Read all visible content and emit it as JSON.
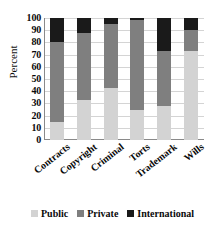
{
  "chart_data": {
    "type": "bar",
    "stacked": true,
    "title": "",
    "xlabel": "",
    "ylabel": "Percent",
    "ylim": [
      0,
      100
    ],
    "ytick_step": 10,
    "yticks": [
      "100",
      "90",
      "80",
      "70",
      "60",
      "50",
      "40",
      "30",
      "20",
      "10",
      "0"
    ],
    "grid": true,
    "legend_position": "bottom",
    "categories": [
      "Contracts",
      "Copyright",
      "Criminal",
      "Torts",
      "Trademark",
      "Wills"
    ],
    "series": [
      {
        "name": "Public",
        "color": "#d3d3d3",
        "values": [
          15,
          33,
          43,
          25,
          28,
          73
        ]
      },
      {
        "name": "Private",
        "color": "#7f7f7f",
        "values": [
          65,
          55,
          52,
          73,
          45,
          17
        ]
      },
      {
        "name": "International",
        "color": "#1a1a1a",
        "values": [
          20,
          12,
          5,
          2,
          27,
          10
        ]
      }
    ]
  },
  "axes": {
    "y_title": "Percent"
  },
  "legend": {
    "items": [
      {
        "label": "Public"
      },
      {
        "label": "Private"
      },
      {
        "label": "International"
      }
    ]
  }
}
